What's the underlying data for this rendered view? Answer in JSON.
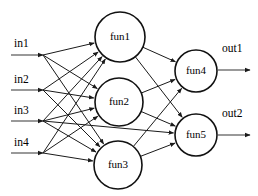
{
  "diagram": {
    "type": "neural-network",
    "width": 258,
    "height": 196,
    "background": "#ffffff",
    "edge_color": "#1a1a1a",
    "node_stroke": "#111111",
    "io_line_color": "#555555"
  },
  "inputs": [
    {
      "id": "in1",
      "label": "in1",
      "label_x": 14,
      "label_y": 47,
      "line_y": 55,
      "line_x1": 11,
      "line_x2": 43
    },
    {
      "id": "in2",
      "label": "in2",
      "label_x": 14,
      "label_y": 83,
      "line_y": 90,
      "line_x1": 11,
      "line_x2": 43
    },
    {
      "id": "in3",
      "label": "in3",
      "label_x": 14,
      "label_y": 114,
      "line_y": 121,
      "line_x1": 11,
      "line_x2": 43
    },
    {
      "id": "in4",
      "label": "in4",
      "label_x": 14,
      "label_y": 146,
      "line_y": 153,
      "line_x1": 11,
      "line_x2": 43
    }
  ],
  "hidden_nodes": [
    {
      "id": "fun1",
      "label": "fun1",
      "cx": 120,
      "cy": 37,
      "r": 25
    },
    {
      "id": "fun2",
      "label": "fun2",
      "cx": 119,
      "cy": 102,
      "r": 24
    },
    {
      "id": "fun3",
      "label": "fun3",
      "cx": 118,
      "cy": 165,
      "r": 24
    }
  ],
  "output_nodes": [
    {
      "id": "fun4",
      "label": "fun4",
      "cx": 196,
      "cy": 71,
      "r": 21
    },
    {
      "id": "fun5",
      "label": "fun5",
      "cx": 196,
      "cy": 135,
      "r": 21
    }
  ],
  "outputs": [
    {
      "id": "out1",
      "label": "out1",
      "label_x": 222,
      "label_y": 52,
      "line_y": 70,
      "line_x1": 218,
      "line_x2": 250
    },
    {
      "id": "out2",
      "label": "out2",
      "label_x": 222,
      "label_y": 117,
      "line_y": 135,
      "line_x1": 218,
      "line_x2": 250
    }
  ],
  "edges": [
    {
      "from": "in1",
      "to": "fun1"
    },
    {
      "from": "in1",
      "to": "fun2"
    },
    {
      "from": "in1",
      "to": "fun3"
    },
    {
      "from": "in2",
      "to": "fun1"
    },
    {
      "from": "in2",
      "to": "fun2"
    },
    {
      "from": "in2",
      "to": "fun3"
    },
    {
      "from": "in3",
      "to": "fun1"
    },
    {
      "from": "in3",
      "to": "fun2"
    },
    {
      "from": "in3",
      "to": "fun3"
    },
    {
      "from": "in3",
      "to": "fun5"
    },
    {
      "from": "in4",
      "to": "fun1"
    },
    {
      "from": "in4",
      "to": "fun2"
    },
    {
      "from": "in4",
      "to": "fun3"
    },
    {
      "from": "fun1",
      "to": "fun4"
    },
    {
      "from": "fun1",
      "to": "fun5"
    },
    {
      "from": "fun2",
      "to": "fun4"
    },
    {
      "from": "fun2",
      "to": "fun5"
    },
    {
      "from": "fun3",
      "to": "fun4"
    },
    {
      "from": "fun3",
      "to": "fun5"
    }
  ]
}
